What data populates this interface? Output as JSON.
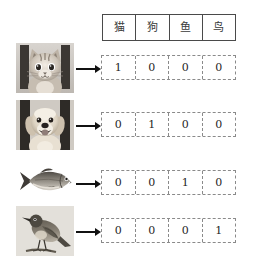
{
  "diagram": {
    "header": {
      "columns": [
        "猫",
        "狗",
        "鱼",
        "鸟"
      ]
    },
    "colors": {
      "background": "#ffffff",
      "table_border": "#4a4a4a",
      "vector_border": "#8a8a8a",
      "arrow": "#111111",
      "text": "#1f1f1f"
    },
    "rows": [
      {
        "image": "cat-photo",
        "image_alt": "猫",
        "arrow": "arrow-right-icon",
        "vector": [
          "1",
          "0",
          "0",
          "0"
        ]
      },
      {
        "image": "dog-photo",
        "image_alt": "狗",
        "arrow": "arrow-right-icon",
        "vector": [
          "0",
          "1",
          "0",
          "0"
        ]
      },
      {
        "image": "fish-photo",
        "image_alt": "鱼",
        "arrow": "arrow-right-icon",
        "vector": [
          "0",
          "0",
          "1",
          "0"
        ]
      },
      {
        "image": "bird-photo",
        "image_alt": "鸟",
        "arrow": "arrow-right-icon",
        "vector": [
          "0",
          "0",
          "0",
          "1"
        ]
      }
    ]
  }
}
